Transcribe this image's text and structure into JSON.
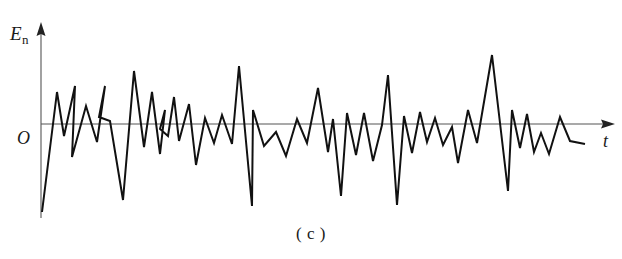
{
  "figure": {
    "caption": "( c )",
    "background_color": "#ffffff",
    "line_color": "#111111",
    "axis_color": "#555555"
  },
  "axes": {
    "y_label_main": "E",
    "y_label_subscript": "n",
    "origin_label": "O",
    "x_label": "t",
    "origin_px": {
      "x": 41,
      "y": 124
    },
    "x_axis": {
      "x1": 41,
      "y1": 124,
      "x2": 615,
      "y2": 124
    },
    "y_axis": {
      "x1": 41,
      "y1": 218,
      "x2": 41,
      "y2": 22
    }
  },
  "chart_data": {
    "type": "line",
    "title": "",
    "subtitle": "",
    "xlabel": "t",
    "ylabel": "E_n",
    "grid": false,
    "legend": null,
    "axis_ranges": {
      "x": [
        0,
        622
      ],
      "y": [
        -100,
        100
      ]
    },
    "series": [
      {
        "name": "noise-voltage",
        "color": "#111111",
        "points": [
          [
            42,
            212
          ],
          [
            57,
            92
          ],
          [
            64,
            136
          ],
          [
            75,
            86
          ],
          [
            72,
            157
          ],
          [
            86,
            106
          ],
          [
            97,
            142
          ],
          [
            105,
            86
          ],
          [
            99,
            117
          ],
          [
            110,
            121
          ],
          [
            123,
            200
          ],
          [
            134,
            71
          ],
          [
            144,
            147
          ],
          [
            152,
            92
          ],
          [
            160,
            154
          ],
          [
            165,
            110
          ],
          [
            160,
            129
          ],
          [
            168,
            136
          ],
          [
            174,
            97
          ],
          [
            179,
            141
          ],
          [
            189,
            104
          ],
          [
            196,
            165
          ],
          [
            205,
            118
          ],
          [
            214,
            143
          ],
          [
            222,
            115
          ],
          [
            232,
            144
          ],
          [
            239,
            66
          ],
          [
            252,
            206
          ],
          [
            253,
            110
          ],
          [
            264,
            146
          ],
          [
            276,
            132
          ],
          [
            286,
            156
          ],
          [
            297,
            119
          ],
          [
            307,
            143
          ],
          [
            318,
            88
          ],
          [
            328,
            152
          ],
          [
            333,
            119
          ],
          [
            341,
            196
          ],
          [
            347,
            113
          ],
          [
            356,
            155
          ],
          [
            364,
            113
          ],
          [
            373,
            161
          ],
          [
            382,
            125
          ],
          [
            388,
            75
          ],
          [
            397,
            205
          ],
          [
            404,
            116
          ],
          [
            412,
            153
          ],
          [
            420,
            112
          ],
          [
            427,
            142
          ],
          [
            435,
            118
          ],
          [
            443,
            145
          ],
          [
            452,
            127
          ],
          [
            458,
            163
          ],
          [
            468,
            110
          ],
          [
            477,
            143
          ],
          [
            492,
            55
          ],
          [
            508,
            191
          ],
          [
            512,
            110
          ],
          [
            520,
            148
          ],
          [
            527,
            114
          ],
          [
            534,
            152
          ],
          [
            541,
            133
          ],
          [
            549,
            154
          ],
          [
            560,
            117
          ],
          [
            570,
            141
          ],
          [
            585,
            144
          ]
        ]
      }
    ]
  }
}
